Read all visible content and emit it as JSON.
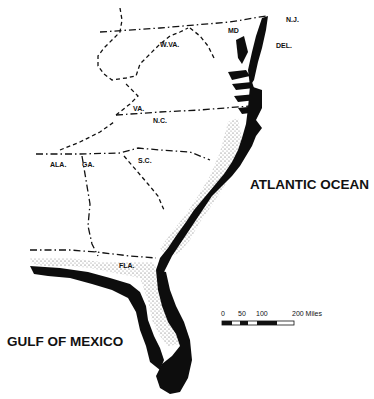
{
  "map": {
    "type": "regional coastal map",
    "region": "U.S. Atlantic and Gulf coast, New Jersey to Florida",
    "colors": {
      "background": "#ffffff",
      "ink": "#111111",
      "coastal_black": "#0d0d0d",
      "stipple": "#555555"
    },
    "water_bodies": {
      "atlantic": "ATLANTIC OCEAN",
      "gulf": "GULF OF MEXICO"
    },
    "states": {
      "nj": "N.J.",
      "md": "MD",
      "del": "DEL.",
      "wva": "W.VA.",
      "va": "VA.",
      "nc": "N.C.",
      "sc": "S.C.",
      "ala": "ALA.",
      "ga": "GA.",
      "fla": "FLA."
    },
    "scale_bar": {
      "ticks": [
        "0",
        "50",
        "100",
        "200 Miles"
      ],
      "unit": "Miles"
    },
    "legend_fills": [
      {
        "pattern": "solid-black",
        "meaning": "coastal zone (black)"
      },
      {
        "pattern": "stipple",
        "meaning": "coastal zone (stippled)"
      }
    ]
  }
}
